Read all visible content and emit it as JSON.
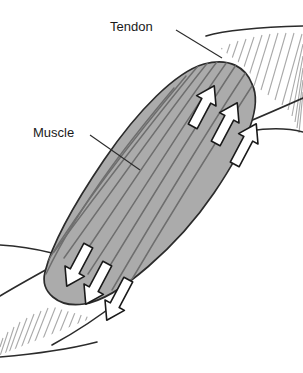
{
  "figure": {
    "width": 303,
    "height": 373,
    "background_color": "#FFFFFF"
  },
  "labels": [
    {
      "id": "tendon",
      "text": "Tendon",
      "x": 110,
      "y": 28,
      "leader_from": [
        176,
        30
      ],
      "leader_to": [
        222,
        58
      ]
    },
    {
      "id": "muscle",
      "text": "Muscle",
      "x": 33,
      "y": 134,
      "leader_from": [
        90,
        135
      ],
      "leader_to": [
        140,
        170
      ]
    }
  ],
  "muscle": {
    "name": "muscle-belly",
    "fill_color": "#ABABAB",
    "outline_color": "#2B2B2B",
    "fiber_line_color": "#6E6E6E",
    "fiber_count": 9,
    "axis_angle_degrees": 65,
    "description": "Spindle-shaped (fusiform) muscle belly oriented lower-left to upper-right"
  },
  "tendons": [
    {
      "name": "tendon-upper-right",
      "hatch_color": "#A9A9A9",
      "boundary_color": "#2B2B2B",
      "hatch_count": 18,
      "position": "upper-right"
    },
    {
      "name": "tendon-lower-left",
      "hatch_color": "#A9A9A9",
      "boundary_color": "#2B2B2B",
      "hatch_count": 18,
      "position": "lower-left"
    }
  ],
  "arrows": {
    "fill_color": "#FFFFFF",
    "outline_color": "#1A1A1A",
    "upper_group": {
      "name": "force-arrows-upper",
      "direction": "up-right",
      "count": 3,
      "meaning": "contraction force toward upper tendon"
    },
    "lower_group": {
      "name": "force-arrows-lower",
      "direction": "down-left",
      "count": 3,
      "meaning": "contraction force toward lower tendon"
    }
  }
}
